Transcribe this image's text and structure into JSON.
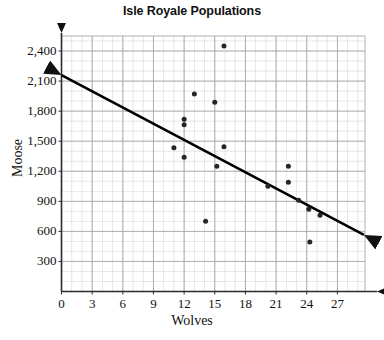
{
  "chart_data": {
    "type": "scatter",
    "title": "Isle Royale Populations",
    "xlabel": "Wolves",
    "ylabel": "Moose",
    "xlim": [
      0,
      29.7
    ],
    "ylim": [
      0,
      2550
    ],
    "xticks": [
      0,
      3,
      6,
      9,
      12,
      15,
      18,
      21,
      24,
      27
    ],
    "xtick_labels": [
      "0",
      "3",
      "6",
      "9",
      "12",
      "15",
      "18",
      "21",
      "24",
      "27"
    ],
    "yticks": [
      300,
      600,
      900,
      1200,
      1500,
      1800,
      2100,
      2400
    ],
    "ytick_labels": [
      "300",
      "600",
      "900",
      "1,200",
      "1,500",
      "1,800",
      "2,100",
      "2,400"
    ],
    "grid": true,
    "grid_minor_step_x": 1.0,
    "grid_minor_step_y": 100,
    "grid_major_step_x": 3,
    "grid_major_step_y": 300,
    "legend": null,
    "point_color": "#262626",
    "grid_color": "#c9c9c9",
    "axis_color": "#3a3a3a",
    "trendline_color": "#000000",
    "points": [
      {
        "x": 15.9,
        "y": 2450
      },
      {
        "x": 13.0,
        "y": 1970
      },
      {
        "x": 15.0,
        "y": 1890
      },
      {
        "x": 12.0,
        "y": 1720
      },
      {
        "x": 12.0,
        "y": 1665
      },
      {
        "x": 11.0,
        "y": 1435
      },
      {
        "x": 12.0,
        "y": 1340
      },
      {
        "x": 15.9,
        "y": 1445
      },
      {
        "x": 15.2,
        "y": 1250
      },
      {
        "x": 14.1,
        "y": 700
      },
      {
        "x": 20.2,
        "y": 1050
      },
      {
        "x": 22.2,
        "y": 1250
      },
      {
        "x": 22.2,
        "y": 1090
      },
      {
        "x": 23.2,
        "y": 910
      },
      {
        "x": 24.2,
        "y": 820
      },
      {
        "x": 25.3,
        "y": 760
      },
      {
        "x": 24.3,
        "y": 495
      }
    ],
    "trendline": {
      "x0": 0.0,
      "y0": 2160,
      "x1": 29.6,
      "y1": 565,
      "arrow_start": true,
      "arrow_end": true
    }
  }
}
